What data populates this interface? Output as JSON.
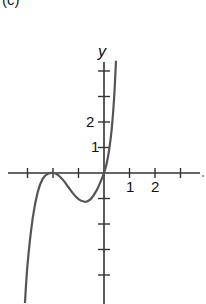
{
  "figure": {
    "panel_label": "(c)",
    "colors": {
      "axis": "#333333",
      "curve": "#555555",
      "background": "#ffffff"
    }
  },
  "chart_data": {
    "type": "line",
    "title": "",
    "xlabel": "",
    "ylabel": "y",
    "xlim": [
      -3.75,
      3.75
    ],
    "ylim": [
      -5.1,
      4.4
    ],
    "grid": false,
    "legend": null,
    "x_ticks": [
      -3,
      -2,
      -1,
      0,
      1,
      2,
      3
    ],
    "x_tick_labels": {
      "1": "1",
      "2": "2"
    },
    "y_ticks": [
      -4,
      -3,
      -2,
      -1,
      1,
      2,
      3,
      4
    ],
    "y_tick_labels": {
      "1": "1",
      "2": "2"
    },
    "series": [
      {
        "name": "curve",
        "x": [
          -3.1,
          -3.0,
          -2.8,
          -2.6,
          -2.4,
          -2.2,
          -2.0,
          -1.8,
          -1.6,
          -1.4,
          -1.2,
          -1.0,
          -0.8,
          -0.67,
          -0.5,
          -0.3,
          -0.15,
          0.0,
          0.1,
          0.2,
          0.3,
          0.4,
          0.47
        ],
        "y": [
          -5.1,
          -3.6,
          -1.8,
          -0.75,
          -0.22,
          -0.03,
          0.0,
          -0.08,
          -0.28,
          -0.55,
          -0.82,
          -1.02,
          -1.12,
          -1.12,
          -1.0,
          -0.7,
          -0.38,
          0.0,
          0.35,
          0.9,
          1.7,
          3.0,
          4.4
        ]
      }
    ],
    "annotations": [
      {
        "text": "y",
        "role": "y-axis label"
      }
    ]
  }
}
